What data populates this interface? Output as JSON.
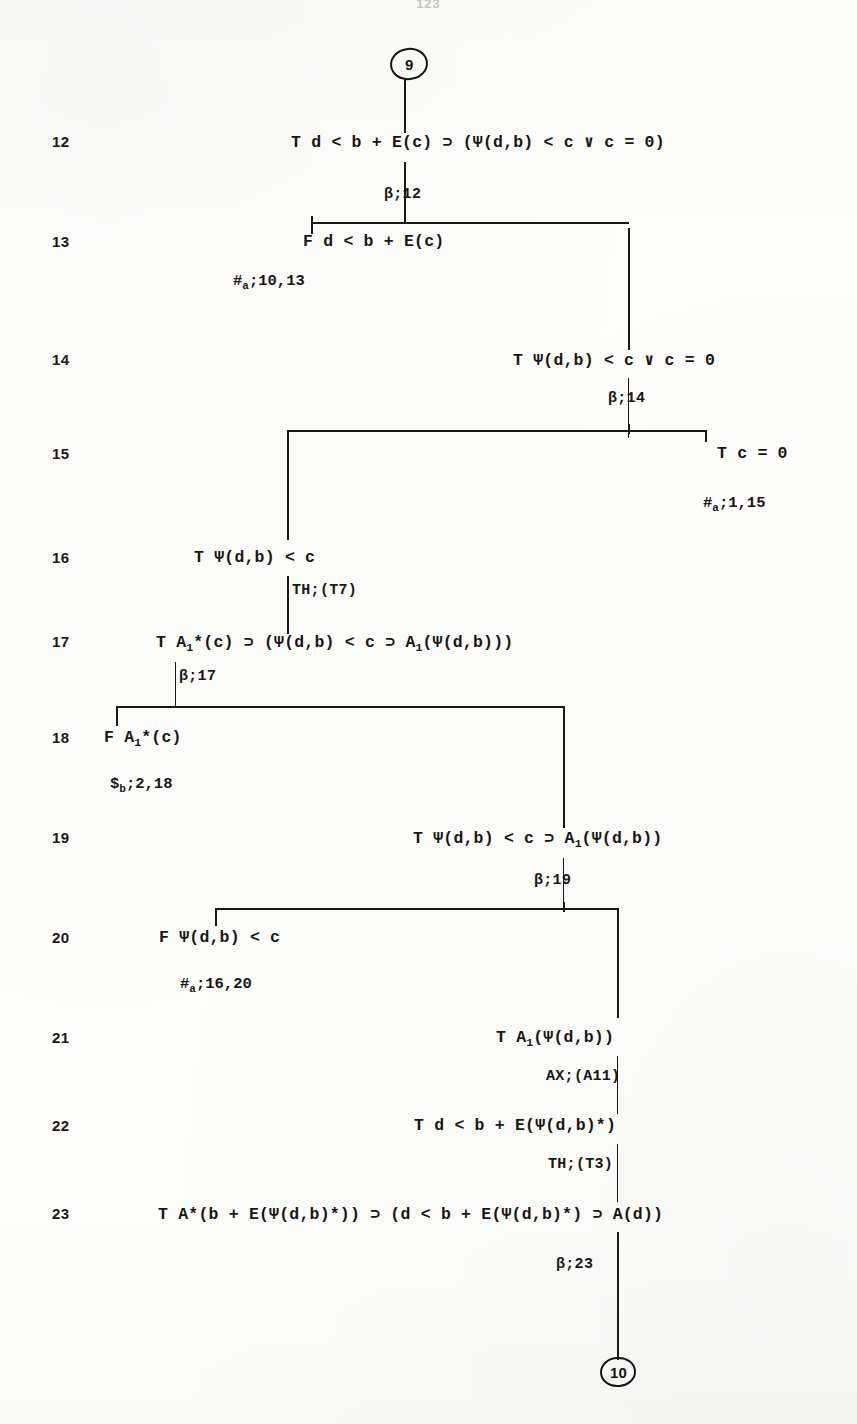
{
  "page": {
    "number": "123",
    "width": 857,
    "height": 1424,
    "ink_color": "#191714",
    "paper_color": "#fdfdfc"
  },
  "nodes": {
    "top": {
      "label": "9"
    },
    "bottom": {
      "label": "10"
    }
  },
  "lines": [
    {
      "number": "12",
      "formula": "T d < b + E(c) ⊃ (Ψ(d,b) < c ∨ c = 0)"
    },
    {
      "number": "13",
      "formula": "F d < b + E(c)"
    },
    {
      "number": "14",
      "formula": "T Ψ(d,b) < c ∨ c = 0"
    },
    {
      "number": "15",
      "formula": "T c = 0"
    },
    {
      "number": "16",
      "formula": "T Ψ(d,b) < c"
    },
    {
      "number": "17",
      "formula_pre": "T A",
      "formula_sub": "1",
      "formula_post": "*(c) ⊃ (Ψ(d,b) < c ⊃ A",
      "formula_sub2": "1",
      "formula_tail": "(Ψ(d,b)))"
    },
    {
      "number": "18",
      "formula_pre": "F A",
      "formula_sub": "1",
      "formula_post": "*(c)"
    },
    {
      "number": "19",
      "formula_pre": "T Ψ(d,b) < c ⊃ A",
      "formula_sub": "1",
      "formula_post": "(Ψ(d,b))"
    },
    {
      "number": "20",
      "formula": "F Ψ(d,b) < c"
    },
    {
      "number": "21",
      "formula_pre": "T A",
      "formula_sub": "1",
      "formula_post": "(Ψ(d,b))"
    },
    {
      "number": "22",
      "formula": "T d < b + E(Ψ(d,b)*)"
    },
    {
      "number": "23",
      "formula": "T A*(b + E(Ψ(d,b)*)) ⊃ (d < b + E(Ψ(d,b)*) ⊃ A(d))"
    }
  ],
  "justifications": [
    {
      "id": "j12",
      "symbol": "β",
      "text": "β;12"
    },
    {
      "id": "j14",
      "symbol": "β",
      "text": "β;14"
    },
    {
      "id": "jTH7",
      "symbol": "TH",
      "text": "TH;(T7)"
    },
    {
      "id": "j17",
      "symbol": "β",
      "text": "β;17"
    },
    {
      "id": "j19",
      "symbol": "β",
      "text": "β;19"
    },
    {
      "id": "jAX",
      "symbol": "AX",
      "text": "AX;(A11)"
    },
    {
      "id": "jTH3",
      "symbol": "TH",
      "text": "TH;(T3)"
    },
    {
      "id": "j23",
      "symbol": "β",
      "text": "β;23"
    }
  ],
  "closures": [
    {
      "id": "c13",
      "mark": "#",
      "sub": "a",
      "refs": ";10,13"
    },
    {
      "id": "c15",
      "mark": "#",
      "sub": "a",
      "refs": ";1,15"
    },
    {
      "id": "c18",
      "mark": "$",
      "sub": "b",
      "refs": ";2,18"
    },
    {
      "id": "c20",
      "mark": "#",
      "sub": "a",
      "refs": ";16,20"
    }
  ]
}
